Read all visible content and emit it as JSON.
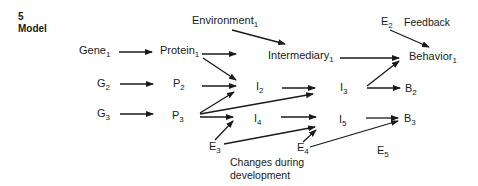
{
  "figure": {
    "number": "5",
    "title": "Model"
  },
  "nodes": {
    "gene1": {
      "base": "Gene",
      "sub": "1"
    },
    "g2": {
      "base": "G",
      "sub": "2"
    },
    "g3": {
      "base": "G",
      "sub": "3"
    },
    "protein1": {
      "base": "Protein",
      "sub": "1"
    },
    "p2": {
      "base": "P",
      "sub": "2"
    },
    "p3": {
      "base": "P",
      "sub": "3"
    },
    "environment1": {
      "base": "Environment",
      "sub": "1"
    },
    "intermediary1": {
      "base": "Intermediary",
      "sub": "1"
    },
    "i2": {
      "base": "I",
      "sub": "2"
    },
    "i3": {
      "base": "I",
      "sub": "3"
    },
    "i4": {
      "base": "I",
      "sub": "4"
    },
    "i5": {
      "base": "I",
      "sub": "5"
    },
    "e2": {
      "base": "E",
      "sub": "2"
    },
    "e3": {
      "base": "E",
      "sub": "3"
    },
    "e4": {
      "base": "E",
      "sub": "4"
    },
    "e5": {
      "base": "E",
      "sub": "5"
    },
    "behavior1": {
      "base": "Behavior",
      "sub": "1"
    },
    "b2": {
      "base": "B",
      "sub": "2"
    },
    "b3": {
      "base": "B",
      "sub": "3"
    }
  },
  "annotations": {
    "feedback": "Feedback",
    "changes_line1": "Changes during",
    "changes_line2": "development"
  },
  "edges": [
    [
      "gene1",
      "protein1"
    ],
    [
      "g2",
      "p2"
    ],
    [
      "g3",
      "p3"
    ],
    [
      "environment1",
      "intermediary1"
    ],
    [
      "protein1",
      "intermediary1"
    ],
    [
      "protein1",
      "i2"
    ],
    [
      "p2",
      "i2"
    ],
    [
      "p3",
      "i2"
    ],
    [
      "p3",
      "i3"
    ],
    [
      "p3",
      "i4"
    ],
    [
      "e3",
      "i4"
    ],
    [
      "e3",
      "i5"
    ],
    [
      "intermediary1",
      "behavior1"
    ],
    [
      "i2",
      "i3"
    ],
    [
      "i3",
      "behavior1"
    ],
    [
      "i3",
      "b2"
    ],
    [
      "i4",
      "i5"
    ],
    [
      "i5",
      "b3"
    ],
    [
      "e4",
      "i5"
    ],
    [
      "e4",
      "b3"
    ],
    [
      "e2",
      "behavior1"
    ]
  ]
}
